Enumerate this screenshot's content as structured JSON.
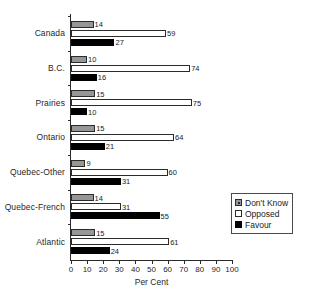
{
  "chart_data": {
    "type": "bar",
    "orientation": "horizontal",
    "grouped": true,
    "title": "",
    "xlabel": "Per Cent",
    "ylabel": "",
    "xlim": [
      0,
      100
    ],
    "xticks": [
      0,
      10,
      20,
      30,
      40,
      50,
      60,
      70,
      80,
      90,
      100
    ],
    "xtick_labels": [
      "0",
      "10",
      "20",
      "30",
      "40",
      "50",
      "60",
      "70",
      "80",
      "90",
      "100"
    ],
    "grid": false,
    "legend_position": "lower-right",
    "categories": [
      "Canada",
      "B.C.",
      "Prairies",
      "Ontario",
      "Quebec-Other",
      "Quebec-French",
      "Atlantic"
    ],
    "series": [
      {
        "name": "Don't Know",
        "color": "#969696",
        "values": [
          14,
          10,
          15,
          15,
          9,
          14,
          15
        ]
      },
      {
        "name": "Opposed",
        "color": "#ffffff",
        "values": [
          59,
          74,
          75,
          64,
          60,
          31,
          61
        ]
      },
      {
        "name": "Favour",
        "color": "#000000",
        "values": [
          27,
          16,
          10,
          21,
          31,
          55,
          24
        ]
      }
    ]
  },
  "legend": {
    "entries": [
      {
        "label": "Don't Know",
        "swatch": "dontknow"
      },
      {
        "label": "Opposed",
        "swatch": "opposed"
      },
      {
        "label": "Favour",
        "swatch": "favour"
      }
    ]
  }
}
